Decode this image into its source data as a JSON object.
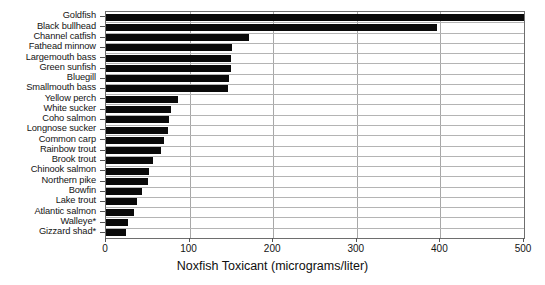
{
  "chart_data": {
    "type": "bar",
    "orientation": "horizontal",
    "title": "",
    "xlabel": "Noxfish Toxicant  (micrograms/liter)",
    "ylabel": "",
    "xlim": [
      0,
      500
    ],
    "xticks": [
      0,
      100,
      200,
      300,
      400,
      500
    ],
    "xtick_labels": [
      "0",
      "100",
      "200",
      "300",
      "400",
      "500"
    ],
    "grid": "vertical-and-horizontal",
    "legend": "none",
    "bar_color": "#0a0a0a",
    "categories": [
      "Goldfish",
      "Black bullhead",
      "Channel catfish",
      "Fathead minnow",
      "Largemouth bass",
      "Green sunfish",
      "Bluegill",
      "Smallmouth bass",
      "Yellow perch",
      "White sucker",
      "Coho salmon",
      "Longnose sucker",
      "Common carp",
      "Rainbow trout",
      "Brook trout",
      "Chinook salmon",
      "Northern pike",
      "Bowfin",
      "Lake trout",
      "Atlantic salmon",
      "Walleye*",
      "Gizzard shad*"
    ],
    "values": [
      500,
      396,
      171,
      151,
      150,
      149,
      147,
      146,
      86,
      78,
      75,
      74,
      69,
      66,
      56,
      51,
      50,
      43,
      37,
      34,
      26,
      24
    ]
  }
}
